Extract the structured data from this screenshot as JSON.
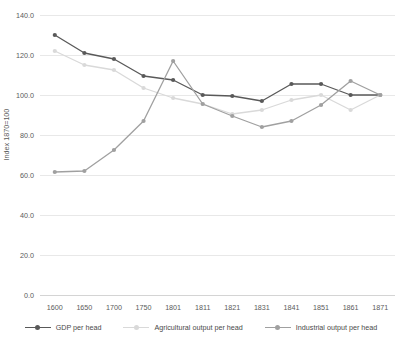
{
  "chart_data": {
    "type": "line",
    "title": "",
    "xlabel": "",
    "ylabel": "Index 1870=100",
    "categories": [
      "1600",
      "1650",
      "1700",
      "1750",
      "1801",
      "1811",
      "1821",
      "1831",
      "1841",
      "1851",
      "1861",
      "1871"
    ],
    "ylim": [
      0,
      140
    ],
    "ytick_values": [
      0,
      20,
      40,
      60,
      80,
      100,
      120,
      140
    ],
    "ytick_labels": [
      "0.0",
      "20.0",
      "40.0",
      "60.0",
      "80.0",
      "100.0",
      "120.0",
      "140.0"
    ],
    "grid": true,
    "legend_position": "bottom",
    "series": [
      {
        "name": "GDP per head",
        "color": "#595959",
        "values": [
          130.0,
          121.0,
          118.0,
          109.5,
          107.5,
          100.0,
          99.5,
          97.0,
          105.5,
          105.5,
          100.0,
          100.0
        ]
      },
      {
        "name": "Agricultural output per head",
        "color": "#d9d9d9",
        "values": [
          122.0,
          115.0,
          112.5,
          103.5,
          98.5,
          95.5,
          90.5,
          92.5,
          97.5,
          100.0,
          92.5,
          100.0
        ]
      },
      {
        "name": "Industrial output per head",
        "color": "#a0a0a0",
        "values": [
          61.5,
          62.0,
          72.5,
          87.0,
          117.0,
          95.5,
          89.5,
          84.0,
          87.0,
          95.0,
          107.0,
          100.0
        ]
      }
    ]
  },
  "legend": {
    "items": [
      {
        "label": "GDP per head"
      },
      {
        "label": "Agricultural output per head"
      },
      {
        "label": "Industrial output per head"
      }
    ]
  },
  "axes": {
    "y_title": "Index 1870=100"
  },
  "colors": {
    "gridline": "#e8e8e8",
    "text": "#5a5a5a",
    "background": "#ffffff"
  }
}
